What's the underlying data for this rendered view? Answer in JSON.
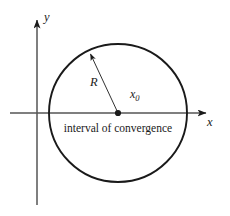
{
  "figure": {
    "type": "math-diagram",
    "background_color": "#ffffff",
    "stroke_color": "#1a1a1a"
  },
  "axes": {
    "x_axis_label": "x",
    "y_axis_label": "y",
    "x_axis": {
      "x1": 10,
      "y1": 113,
      "x2": 212,
      "y2": 113,
      "arrow": "right"
    },
    "y_axis": {
      "x1": 37,
      "y1": 205,
      "x2": 37,
      "y2": 14,
      "arrow": "up"
    },
    "x_label_pos": {
      "x": 208,
      "y": 125
    },
    "y_label_pos": {
      "x": 44,
      "y": 20
    }
  },
  "circle": {
    "center_x": 118,
    "center_y": 113,
    "radius": 69,
    "stroke_width": 1.9
  },
  "center_point": {
    "label": "x₀",
    "label_base": "x",
    "label_sub": "0",
    "x": 118,
    "y": 113,
    "dot_radius": 3.1,
    "label_pos": {
      "x": 132,
      "y": 97
    }
  },
  "radius_annotation": {
    "label": "R",
    "from_x": 118,
    "from_y": 113,
    "to_x": 88,
    "to_y": 50,
    "label_pos": {
      "x": 92,
      "y": 85
    },
    "arrow": "to-circle"
  },
  "caption": {
    "text": "interval of convergence",
    "x": 118,
    "y": 131,
    "font_size": 11.5
  }
}
